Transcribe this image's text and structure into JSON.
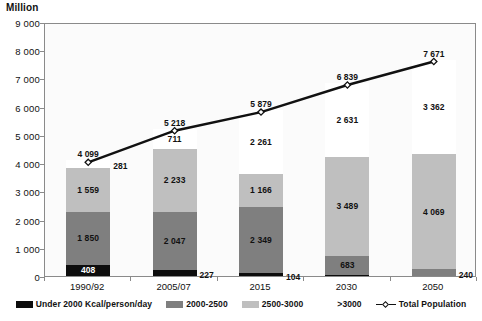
{
  "chart_data": {
    "type": "bar",
    "title": "",
    "subtitle": "",
    "xlabel": "",
    "ylabel": "Million",
    "ylim": [
      0,
      9000
    ],
    "ytick_step": 1000,
    "ytick_labels": [
      "0",
      "1 000",
      "2 000",
      "3 000",
      "4 000",
      "5 000",
      "6 000",
      "7 000",
      "8 000",
      "9 000"
    ],
    "grid": false,
    "stacked": true,
    "legend_position": "bottom",
    "categories": [
      "1990/92",
      "2005/07",
      "2015",
      "2030",
      "2050"
    ],
    "series": [
      {
        "name": "Under 2000 Kcal/person/day",
        "color": "#0d0d0d",
        "values": [
          408,
          227,
          104,
          36,
          0
        ],
        "labels": [
          "408",
          "227",
          "104",
          "",
          ""
        ]
      },
      {
        "name": "2000-2500",
        "color": "#7f7f7f",
        "values": [
          1850,
          2047,
          2349,
          683,
          240
        ],
        "labels": [
          "1 850",
          "2 047",
          "2 349",
          "683",
          "240"
        ]
      },
      {
        "name": "2500-3000",
        "color": "#bfbfbf",
        "values": [
          1559,
          2233,
          1166,
          3489,
          4069
        ],
        "labels": [
          "1 559",
          "2 233",
          "1 166",
          "3 489",
          "4 069"
        ]
      },
      {
        "name": ">3000",
        "color": "#ffffff",
        "values": [
          281,
          711,
          2261,
          2631,
          3362
        ],
        "labels": [
          "281",
          "711",
          "2 261",
          "2 631",
          "3 362"
        ]
      }
    ],
    "line_series": {
      "name": "Total Population",
      "color": "#111111",
      "values": [
        4099,
        5218,
        5879,
        6839,
        7671
      ],
      "labels": [
        "4 099",
        "5 218",
        "5 879",
        "6 839",
        "7 671"
      ]
    }
  },
  "legend": {
    "items": [
      {
        "label": "Under 2000 Kcal/person/day",
        "color": "#0d0d0d",
        "kind": "swatch"
      },
      {
        "label": "2000-2500",
        "color": "#7f7f7f",
        "kind": "swatch"
      },
      {
        "label": "2500-3000",
        "color": "#bfbfbf",
        "kind": "swatch"
      },
      {
        "label": ">3000",
        "color": "#ffffff",
        "kind": "swatch"
      },
      {
        "label": "Total Population",
        "color": "#111111",
        "kind": "line"
      }
    ]
  }
}
